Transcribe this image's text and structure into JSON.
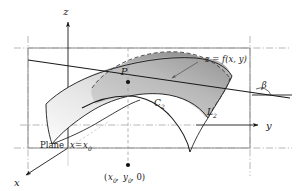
{
  "figure": {
    "axes": {
      "z_label": "z",
      "y_label": "y",
      "x_label": "x"
    },
    "labels": {
      "surface_equation": "z = f(x, y)",
      "point_p": "P",
      "curve_c2": "C",
      "curve_c2_sub": "2",
      "tangent_l2": "L",
      "tangent_l2_sub": "2",
      "angle_beta": "β",
      "plane_text": "Plane",
      "plane_eq_x": "x",
      "plane_eq_equals": "=",
      "plane_eq_x0": "x",
      "plane_eq_x0_sub": "0",
      "base_point": "(x₀, y₀, 0)",
      "base_point_open": "(",
      "base_point_x": "x",
      "base_point_x_sub": "0",
      "base_point_comma1": ", ",
      "base_point_y": "y",
      "base_point_y_sub": "0",
      "base_point_comma2": ", 0)"
    },
    "colors": {
      "ink": "#1a1a1a",
      "dash": "#8c8c8c",
      "surface_light": "#f2f2f2",
      "surface_mid": "#c9c9c9",
      "surface_dark": "#8f8f8f",
      "background": "#ffffff"
    },
    "geometry": {
      "origin": [
        68,
        148
      ],
      "z_axis_tip": [
        68,
        18
      ],
      "y_axis_tip": [
        247,
        125
      ],
      "x_axis_tip": [
        22,
        178
      ],
      "point_p": [
        128,
        82
      ],
      "base_point": [
        128,
        165
      ],
      "plane_rect": [
        [
          28,
          48
        ],
        [
          250,
          48
        ],
        [
          250,
          148
        ],
        [
          28,
          148
        ]
      ]
    }
  }
}
